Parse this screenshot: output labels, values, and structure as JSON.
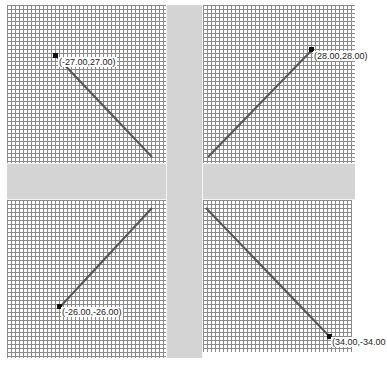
{
  "canvas": {
    "width": 383,
    "height": 370,
    "grid_color": "#8a8a8a",
    "band_color": "#d4d4d4",
    "line_color": "#555555"
  },
  "quadrants": [
    {
      "id": "top-left",
      "left": 7,
      "top": 5,
      "width": 159,
      "height": 158
    },
    {
      "id": "top-right",
      "left": 203,
      "top": 5,
      "width": 152,
      "height": 158
    },
    {
      "id": "bottom-left",
      "left": 7,
      "top": 200,
      "width": 159,
      "height": 158
    },
    {
      "id": "bottom-right",
      "left": 203,
      "top": 200,
      "width": 149,
      "height": 152
    }
  ],
  "segments": [
    {
      "quadrant": "top-left",
      "x1": 56,
      "y1": 56,
      "x2": 152,
      "y2": 157,
      "label": "(-27.00,27.00)",
      "label_x": 58,
      "label_y": 52
    },
    {
      "quadrant": "top-right",
      "x1": 312,
      "y1": 50,
      "x2": 208,
      "y2": 157,
      "label": "(28.00,28.00)",
      "label_x": 313,
      "label_y": 46
    },
    {
      "quadrant": "bottom-left",
      "x1": 60,
      "y1": 307,
      "x2": 152,
      "y2": 208,
      "label": "(-26.00,-26.00)",
      "label_x": 61,
      "label_y": 304
    },
    {
      "quadrant": "bottom-right",
      "x1": 330,
      "y1": 337,
      "x2": 206,
      "y2": 208,
      "label": "(34.00,-34.00",
      "label_x": 331,
      "label_y": 335
    }
  ],
  "labels": {
    "tl": "(-27.00,27.00)",
    "tr": "(28.00,28.00)",
    "bl": "(-26.00,-26.00)",
    "br": "(34.00,-34.00"
  }
}
